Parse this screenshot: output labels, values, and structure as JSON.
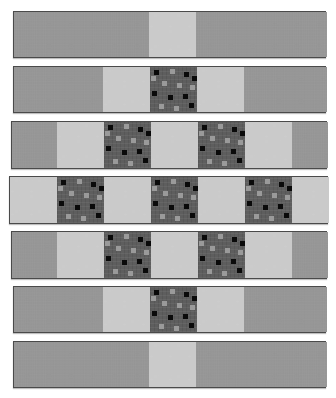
{
  "figure": {
    "kind": "quilt-strip-diagram",
    "canvas_width": 336,
    "canvas_height": 398,
    "background_color": "#ffffff",
    "strip_border_color": "#4a4a4a"
  },
  "fabrics": [
    {
      "id": "light",
      "name": "Light Gray Snowflake Print",
      "color": "#c6c6c6",
      "motif": "snowflake"
    },
    {
      "id": "dark",
      "name": "Black Floral Vine Print",
      "color": "#0b0b0b",
      "motif": "floral-vine"
    },
    {
      "id": "gray",
      "name": "Medium Gray Square Dot Print",
      "color": "#5e5e5e",
      "motif": "scattered-squares"
    }
  ],
  "rows": [
    {
      "index": 1,
      "label": "Row 1",
      "x": 13,
      "y": 11,
      "width": 313,
      "height": 47,
      "blocks": [
        {
          "fabric": "light",
          "width": 135
        },
        {
          "fabric": "dark",
          "width": 47
        },
        {
          "fabric": "light",
          "width": 131
        }
      ]
    },
    {
      "index": 2,
      "label": "Row 2",
      "x": 13,
      "y": 66,
      "width": 313,
      "height": 47,
      "blocks": [
        {
          "fabric": "light",
          "width": 89
        },
        {
          "fabric": "dark",
          "width": 47
        },
        {
          "fabric": "gray",
          "width": 47
        },
        {
          "fabric": "dark",
          "width": 47
        },
        {
          "fabric": "light",
          "width": 83
        }
      ]
    },
    {
      "index": 3,
      "label": "Row 3",
      "x": 11,
      "y": 121,
      "width": 316,
      "height": 48,
      "blocks": [
        {
          "fabric": "light",
          "width": 45
        },
        {
          "fabric": "dark",
          "width": 47
        },
        {
          "fabric": "gray",
          "width": 47
        },
        {
          "fabric": "dark",
          "width": 47
        },
        {
          "fabric": "gray",
          "width": 47
        },
        {
          "fabric": "dark",
          "width": 47
        },
        {
          "fabric": "light",
          "width": 36
        }
      ]
    },
    {
      "index": 4,
      "label": "Row 4",
      "x": 9,
      "y": 176,
      "width": 319,
      "height": 48,
      "blocks": [
        {
          "fabric": "dark",
          "width": 47
        },
        {
          "fabric": "gray",
          "width": 47
        },
        {
          "fabric": "dark",
          "width": 47
        },
        {
          "fabric": "gray",
          "width": 47
        },
        {
          "fabric": "dark",
          "width": 47
        },
        {
          "fabric": "gray",
          "width": 47
        },
        {
          "fabric": "dark",
          "width": 37
        }
      ]
    },
    {
      "index": 5,
      "label": "Row 5",
      "x": 11,
      "y": 231,
      "width": 316,
      "height": 48,
      "blocks": [
        {
          "fabric": "light",
          "width": 45
        },
        {
          "fabric": "dark",
          "width": 47
        },
        {
          "fabric": "gray",
          "width": 47
        },
        {
          "fabric": "dark",
          "width": 47
        },
        {
          "fabric": "gray",
          "width": 47
        },
        {
          "fabric": "dark",
          "width": 47
        },
        {
          "fabric": "light",
          "width": 36
        }
      ]
    },
    {
      "index": 6,
      "label": "Row 6",
      "x": 13,
      "y": 286,
      "width": 313,
      "height": 47,
      "blocks": [
        {
          "fabric": "light",
          "width": 89
        },
        {
          "fabric": "dark",
          "width": 47
        },
        {
          "fabric": "gray",
          "width": 47
        },
        {
          "fabric": "dark",
          "width": 47
        },
        {
          "fabric": "light",
          "width": 83
        }
      ]
    },
    {
      "index": 7,
      "label": "Row 7",
      "x": 13,
      "y": 341,
      "width": 313,
      "height": 47,
      "blocks": [
        {
          "fabric": "light",
          "width": 135
        },
        {
          "fabric": "dark",
          "width": 47
        },
        {
          "fabric": "light",
          "width": 131
        }
      ]
    }
  ],
  "gray_dot_positions": [
    {
      "x": 4,
      "y": 3,
      "tone": "dk"
    },
    {
      "x": 20,
      "y": 2,
      "tone": "lt"
    },
    {
      "x": 34,
      "y": 5,
      "tone": "dk"
    },
    {
      "x": 12,
      "y": 14,
      "tone": "lt"
    },
    {
      "x": 27,
      "y": 16,
      "tone": "lt"
    },
    {
      "x": 40,
      "y": 18,
      "tone": "lt"
    },
    {
      "x": 2,
      "y": 24,
      "tone": "dk"
    },
    {
      "x": 18,
      "y": 28,
      "tone": "dk"
    },
    {
      "x": 33,
      "y": 27,
      "tone": "dk"
    },
    {
      "x": 9,
      "y": 37,
      "tone": "lt"
    },
    {
      "x": 24,
      "y": 39,
      "tone": "lt"
    },
    {
      "x": 39,
      "y": 36,
      "tone": "dk"
    },
    {
      "x": 1,
      "y": 9,
      "tone": "lt"
    },
    {
      "x": 42,
      "y": 9,
      "tone": "dk"
    }
  ]
}
